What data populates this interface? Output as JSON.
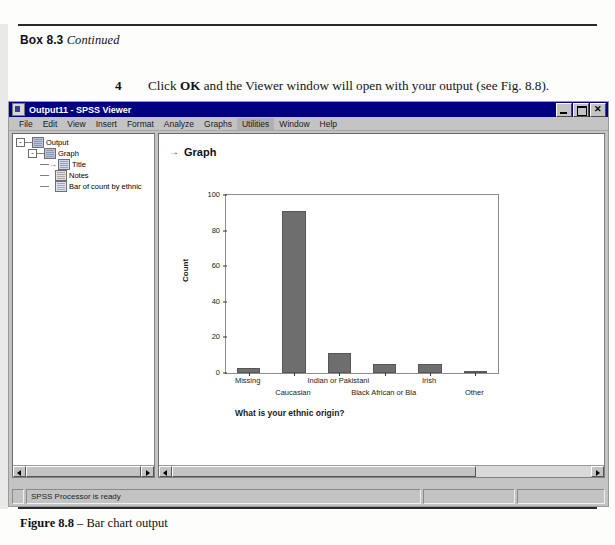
{
  "book": {
    "box_label": "Box 8.3",
    "box_state": "Continued",
    "step_number": "4",
    "step_text_parts": {
      "a": "Click ",
      "b": "OK",
      "c": " and the Viewer window will open with your output (see Fig. 8.8)."
    },
    "figure_caption_bold": "Figure 8.8",
    "figure_caption_rest": " – Bar chart output"
  },
  "window": {
    "title": "Output11 - SPSS Viewer",
    "icon": "spss-viewer-icon",
    "buttons": {
      "minimize": "minimize-button",
      "restore": "restore-button",
      "close": "close-button",
      "close_glyph": "✕"
    },
    "menus": [
      {
        "label": "File"
      },
      {
        "label": "Edit"
      },
      {
        "label": "View"
      },
      {
        "label": "Insert"
      },
      {
        "label": "Format"
      },
      {
        "label": "Analyze"
      },
      {
        "label": "Graphs"
      },
      {
        "label": "Utilities"
      },
      {
        "label": "Window"
      },
      {
        "label": "Help"
      }
    ],
    "selected_menu": "Utilities"
  },
  "outline": {
    "nodes": [
      {
        "label": "Output",
        "expander": "-",
        "icon": "output-folder-icon"
      },
      {
        "label": "Graph",
        "expander": "-",
        "icon": "graph-book-icon"
      },
      {
        "label": "Title",
        "expander": "",
        "icon": "title-item-icon",
        "marker": "→"
      },
      {
        "label": "Notes",
        "expander": "",
        "icon": "notes-item-icon"
      },
      {
        "label": "Bar of count by ethnic",
        "expander": "",
        "icon": "chart-item-icon"
      }
    ]
  },
  "content": {
    "heading": "Graph",
    "heading_marker": "→"
  },
  "statusbar": {
    "message": "SPSS Processor  is ready",
    "cell2": "",
    "cell3": ""
  },
  "chart_data": {
    "type": "bar",
    "title": "",
    "categories": [
      "Missing",
      "Caucasian",
      "Indian or Pakistani",
      "Black African or Bla",
      "Irish",
      "Other"
    ],
    "values": [
      3,
      91,
      11,
      5,
      5,
      1
    ],
    "xlabel": "What is your ethnic origin?",
    "ylabel": "Count",
    "ylim": [
      0,
      100
    ],
    "yticks": [
      0,
      20,
      40,
      60,
      80,
      100
    ],
    "grid": false,
    "legend": "none",
    "bar_color": "#6e6e6e",
    "frame_color": "#8d8d8d"
  }
}
